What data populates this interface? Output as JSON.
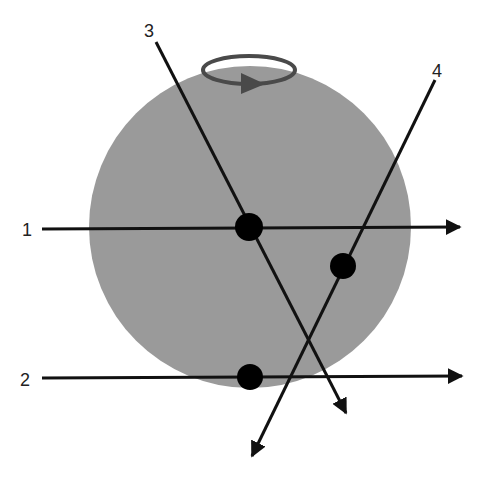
{
  "diagram": {
    "sphere": {
      "cx": 250,
      "cy": 227,
      "r": 161,
      "color": "#9a9a9a"
    },
    "rotation_indicator": {
      "label": "rotation-arrow",
      "cx": 249,
      "cy": 70,
      "rx": 46,
      "ry": 14,
      "color": "#4a4a4a"
    },
    "lines": [
      {
        "id": "1",
        "label": "1",
        "x1": 42,
        "y1": 229,
        "x2": 460,
        "y2": 227,
        "label_x": 22,
        "label_y": 236
      },
      {
        "id": "2",
        "label": "2",
        "x1": 42,
        "y1": 378,
        "x2": 462,
        "y2": 376,
        "label_x": 20,
        "label_y": 386
      },
      {
        "id": "3",
        "label": "3",
        "x1": 156,
        "y1": 42,
        "x2": 346,
        "y2": 413,
        "label_x": 144,
        "label_y": 37
      },
      {
        "id": "4",
        "label": "4",
        "x1": 435,
        "y1": 80,
        "x2": 252,
        "y2": 456,
        "label_x": 432,
        "label_y": 77
      }
    ],
    "points": [
      {
        "id": "p1",
        "cx": 249,
        "cy": 227,
        "r": 14
      },
      {
        "id": "p2",
        "cx": 343,
        "cy": 266,
        "r": 13
      },
      {
        "id": "p3",
        "cx": 250,
        "cy": 377,
        "r": 13
      }
    ]
  }
}
